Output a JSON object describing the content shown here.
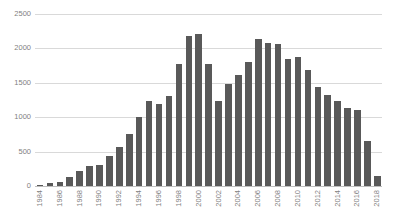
{
  "chart_data": {
    "type": "bar",
    "title": "",
    "subtitle": "",
    "xlabel": "",
    "ylabel": "",
    "ylim": [
      0,
      2500
    ],
    "ytick_step": 500,
    "yticks": [
      0,
      500,
      1000,
      1500,
      2000,
      2500
    ],
    "ytick_labels": [
      "0",
      "500",
      "1000",
      "1500",
      "2000",
      "2500"
    ],
    "grid": true,
    "legend": false,
    "legend_position": "none",
    "xtick_rotation": -90,
    "xtick_interval_years": 2,
    "bar_color": "#595959",
    "gridline_color": "#d9d9d9",
    "axis_text_color": "#7f7f7f",
    "background": "#ffffff",
    "categories": [
      "1984",
      "1985",
      "1986",
      "1987",
      "1988",
      "1989",
      "1990",
      "1991",
      "1992",
      "1993",
      "1994",
      "1995",
      "1996",
      "1997",
      "1998",
      "1999",
      "2000",
      "2001",
      "2002",
      "2003",
      "2004",
      "2005",
      "2006",
      "2007",
      "2008",
      "2009",
      "2010",
      "2011",
      "2012",
      "2013",
      "2014",
      "2015",
      "2016",
      "2017",
      "2018"
    ],
    "visible_tick_labels": [
      "1984",
      "",
      "1986",
      "",
      "1988",
      "",
      "1990",
      "",
      "1992",
      "",
      "1994",
      "",
      "1996",
      "",
      "1998",
      "",
      "2000",
      "",
      "2002",
      "",
      "2004",
      "",
      "2006",
      "",
      "2008",
      "",
      "2010",
      "",
      "2012",
      "",
      "2014",
      "",
      "2016",
      "",
      "2018"
    ],
    "values": [
      20,
      40,
      60,
      130,
      220,
      290,
      300,
      430,
      560,
      760,
      1000,
      1240,
      1190,
      1310,
      1780,
      2180,
      2210,
      1780,
      1240,
      1480,
      1620,
      1800,
      2130,
      2080,
      2060,
      1840,
      1870,
      1680,
      1440,
      1330,
      1230,
      1130,
      1110,
      660,
      150
    ]
  }
}
